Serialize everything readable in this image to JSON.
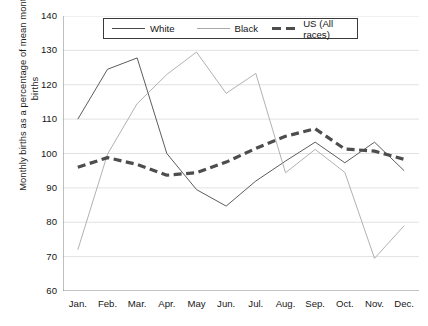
{
  "chart_data": {
    "type": "line",
    "title": "",
    "xlabel": "",
    "ylabel": "Monthly births as a percentage of mean monthly births",
    "categories": [
      "Jan.",
      "Feb.",
      "Mar.",
      "Apr.",
      "May",
      "Jun.",
      "Jul.",
      "Aug.",
      "Sep.",
      "Oct.",
      "Nov.",
      "Dec."
    ],
    "ylim": [
      60,
      140
    ],
    "ytick_step": 10,
    "yticks": [
      140,
      130,
      120,
      110,
      100,
      90,
      80,
      70,
      60
    ],
    "grid": "horizontal",
    "legend_position": "top-center",
    "series": [
      {
        "name": "White",
        "style": "solid-thin",
        "color": "#4a4a4a",
        "values": [
          110.0,
          124.5,
          127.8,
          100.0,
          89.5,
          84.7,
          92.0,
          97.8,
          103.3,
          97.3,
          103.3,
          95.0
        ]
      },
      {
        "name": "Black",
        "style": "solid-thin-light",
        "color": "#a8a8a8",
        "values": [
          72.0,
          99.8,
          114.5,
          123.0,
          129.5,
          117.5,
          123.3,
          94.4,
          101.2,
          94.5,
          69.5,
          79.0
        ]
      },
      {
        "name": "US (All races)",
        "style": "dashed-thick",
        "color": "#4d4d4d",
        "values": [
          96.0,
          98.8,
          96.8,
          93.7,
          94.4,
          97.5,
          101.5,
          105.0,
          107.2,
          101.3,
          100.7,
          98.3
        ]
      }
    ]
  },
  "legend": {
    "items": [
      {
        "label": "White"
      },
      {
        "label": "Black"
      },
      {
        "label": "US (All races)"
      }
    ]
  },
  "axis": {
    "y_title_line1": "Monthly births as a percentage of mean monthly",
    "y_title_line2": "births"
  },
  "colors": {
    "white_series": "#4a4a4a",
    "black_series": "#a8a8a8",
    "us_series": "#4d4d4d",
    "axis": "#8a8a8a",
    "grid": "#e2e2e2",
    "text": "#171717"
  }
}
